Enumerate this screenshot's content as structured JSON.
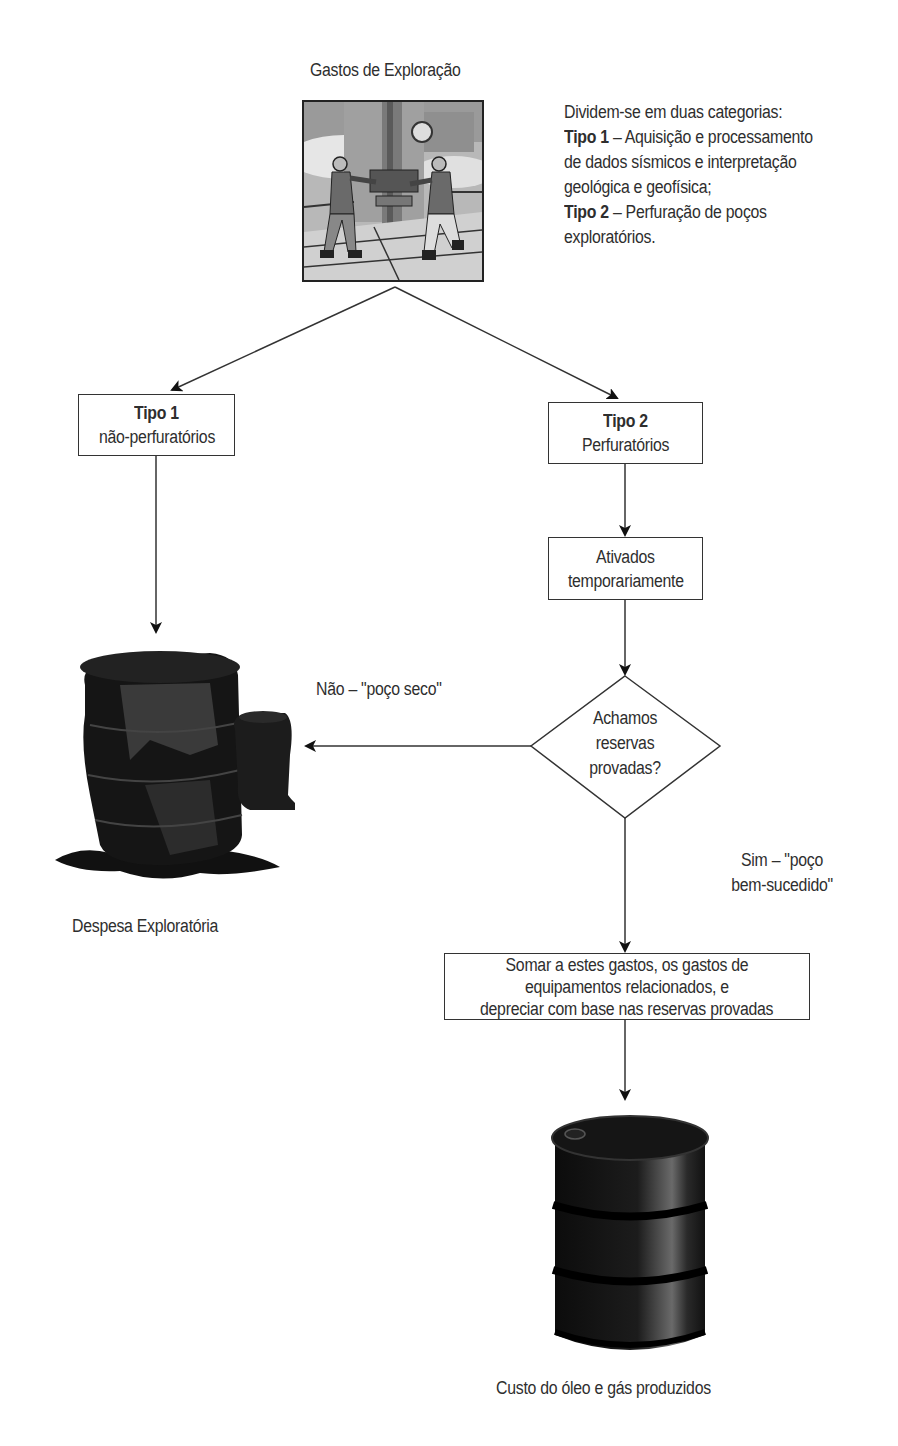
{
  "diagram": {
    "top": {
      "title": "Gastos de  Exploração",
      "image": "oil-rig-workers-illustration"
    },
    "description": {
      "intro": "Dividem-se em duas categorias:",
      "tipo1_label": "Tipo 1",
      "tipo1_text_line1": " – Aquisição e processamento",
      "tipo1_text_line2": "de dados sísmicos e interpretação",
      "tipo1_text_line3": "geológica e geofísica;",
      "tipo2_label": "Tipo 2",
      "tipo2_text_line1": " – Perfuração de poços",
      "tipo2_text_line2": "exploratórios."
    },
    "nodes": {
      "tipo1": {
        "title": "Tipo 1",
        "subtitle": "não-perfuratórios"
      },
      "tipo2": {
        "title": "Tipo 2",
        "subtitle": "Perfuratórios"
      },
      "ativados": {
        "line1": "Ativados",
        "line2": "temporariamente"
      },
      "decision": {
        "line1": "Achamos",
        "line2": "reservas",
        "line3": "provadas?"
      },
      "somar": {
        "line1": "Somar a estes gastos, os gastos de",
        "line2": "equipamentos relacionados, e",
        "line3": "depreciar com base nas reservas provadas"
      }
    },
    "edges": {
      "no_label": "Não – \"poço seco\"",
      "yes_label_line1": "Sim – \"poço",
      "yes_label_line2": "bem-sucedido\""
    },
    "outcomes": {
      "dry_well": {
        "caption": "Despesa Exploratória",
        "image": "spilled-oil-barrel"
      },
      "successful": {
        "caption": "Custo do óleo e gás produzidos",
        "image": "oil-barrel"
      }
    }
  }
}
